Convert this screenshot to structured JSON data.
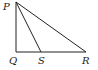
{
  "diagram": {
    "type": "triangle",
    "points": {
      "P": {
        "label": "P",
        "x": 16,
        "y": 2,
        "lx": 3,
        "ly": 10
      },
      "Q": {
        "label": "Q",
        "x": 16,
        "y": 52,
        "lx": 9,
        "ly": 64
      },
      "S": {
        "label": "S",
        "x": 41,
        "y": 52,
        "lx": 38,
        "ly": 64
      },
      "R": {
        "label": "R",
        "x": 86,
        "y": 52,
        "lx": 82,
        "ly": 64
      }
    },
    "segments": [
      "PQ",
      "QR",
      "PR",
      "PS"
    ],
    "line_color": "#222222"
  }
}
